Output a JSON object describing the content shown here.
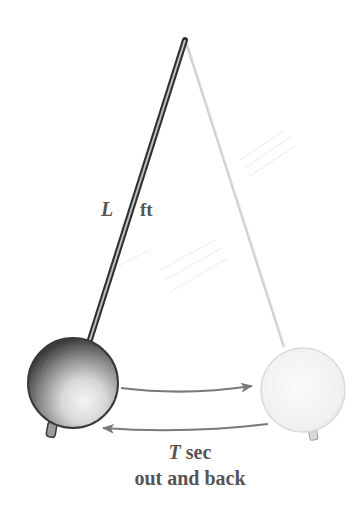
{
  "figure": {
    "length_label": {
      "variable": "L",
      "unit": "ft"
    },
    "period_label": {
      "variable": "T",
      "unit": "sec",
      "note": "out and back"
    }
  },
  "elements": {
    "pivot": {
      "x": 184,
      "y": 40
    },
    "left_bob": {
      "cx": 73,
      "cy": 383,
      "r": 45,
      "shade": "dark"
    },
    "right_bob": {
      "cx": 303,
      "cy": 390,
      "r": 42,
      "shade": "faded"
    },
    "arrows": [
      {
        "direction": "right",
        "label": "outward swing"
      },
      {
        "direction": "left",
        "label": "return swing"
      }
    ]
  },
  "colors": {
    "text": "#555555",
    "rod_dark": "#3a3a3a",
    "rod_light": "#c8c8c8",
    "arrow": "#7a7a7a",
    "bob_dark": "#6b6b6b",
    "bob_light": "#ececec"
  }
}
